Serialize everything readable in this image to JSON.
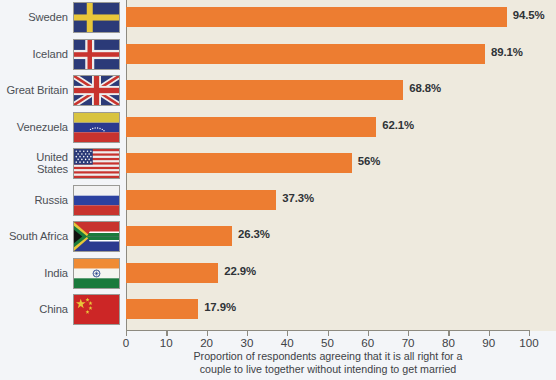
{
  "chart_data": {
    "type": "bar",
    "orientation": "horizontal",
    "title": "",
    "subtitle": "",
    "xlabel": "Proportion of respondents agreeing that it is all right for a couple to live together without intending to get married",
    "ylabel": "",
    "xlim": [
      0,
      100
    ],
    "xticks": [
      0,
      10,
      20,
      30,
      40,
      50,
      60,
      70,
      80,
      90,
      100
    ],
    "xtick_labels": [
      "0",
      "10",
      "20",
      "30",
      "40",
      "50",
      "60",
      "70",
      "80",
      "90",
      "100"
    ],
    "grid": false,
    "legend": null,
    "categories": [
      "Sweden",
      "Iceland",
      "Great Britain",
      "Venezuela",
      "United States",
      "Russia",
      "South Africa",
      "India",
      "China"
    ],
    "values": [
      94.5,
      89.1,
      68.8,
      62.1,
      56,
      37.3,
      26.3,
      22.9,
      17.9
    ],
    "data_labels": [
      "94.5%",
      "89.1%",
      "68.8%",
      "62.1%",
      "56%",
      "37.3%",
      "26.3%",
      "22.9%",
      "17.9%"
    ],
    "bar_color": "#ed7d31",
    "plot_background": "#eeeade",
    "page_background": "#f3f5f8",
    "axis_color": "#8d8a80",
    "text_color": "#3e4246"
  },
  "axis_caption": {
    "line1": "Proportion of respondents agreeing that it is all right for a",
    "line2": "couple to live together without intending to get married"
  },
  "rows": [
    {
      "label": "Sweden",
      "label_line1": "Sweden",
      "label_line2": "",
      "value": 94.5,
      "value_label": "94.5%",
      "flag": "flag-sweden"
    },
    {
      "label": "Iceland",
      "label_line1": "Iceland",
      "label_line2": "",
      "value": 89.1,
      "value_label": "89.1%",
      "flag": "flag-iceland"
    },
    {
      "label": "Great Britain",
      "label_line1": "Great Britain",
      "label_line2": "",
      "value": 68.8,
      "value_label": "68.8%",
      "flag": "flag-great-britain"
    },
    {
      "label": "Venezuela",
      "label_line1": "Venezuela",
      "label_line2": "",
      "value": 62.1,
      "value_label": "62.1%",
      "flag": "flag-venezuela"
    },
    {
      "label": "United States",
      "label_line1": "United",
      "label_line2": "States",
      "value": 56,
      "value_label": "56%",
      "flag": "flag-united-states"
    },
    {
      "label": "Russia",
      "label_line1": "Russia",
      "label_line2": "",
      "value": 37.3,
      "value_label": "37.3%",
      "flag": "flag-russia"
    },
    {
      "label": "South Africa",
      "label_line1": "South Africa",
      "label_line2": "",
      "value": 26.3,
      "value_label": "26.3%",
      "flag": "flag-south-africa"
    },
    {
      "label": "India",
      "label_line1": "India",
      "label_line2": "",
      "value": 22.9,
      "value_label": "22.9%",
      "flag": "flag-india"
    },
    {
      "label": "China",
      "label_line1": "China",
      "label_line2": "",
      "value": 17.9,
      "value_label": "17.9%",
      "flag": "flag-china"
    }
  ]
}
